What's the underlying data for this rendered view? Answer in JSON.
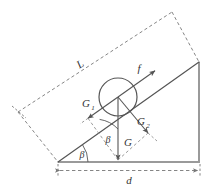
{
  "figure": {
    "colors": {
      "stroke": "#555555",
      "dashed": "#777777",
      "ground": "#999999",
      "text": "#333333",
      "background": "#ffffff"
    },
    "labels": {
      "slope_length": "L",
      "friction_force": "f",
      "weight": "G",
      "component_along_slope": "G",
      "component_along_slope_sub": "1",
      "component_normal_slope": "G",
      "component_normal_slope_sub": "2",
      "angle_base": "β",
      "angle_decomposition": "β",
      "base_length": "d"
    },
    "geometry": {
      "incline_angle_deg": 35,
      "base_start_x": 58,
      "base_end_x": 199,
      "base_y": 162,
      "apex_x": 199,
      "apex_y": 62,
      "circle_center_x": 118,
      "circle_center_y": 97,
      "circle_radius": 19
    }
  }
}
